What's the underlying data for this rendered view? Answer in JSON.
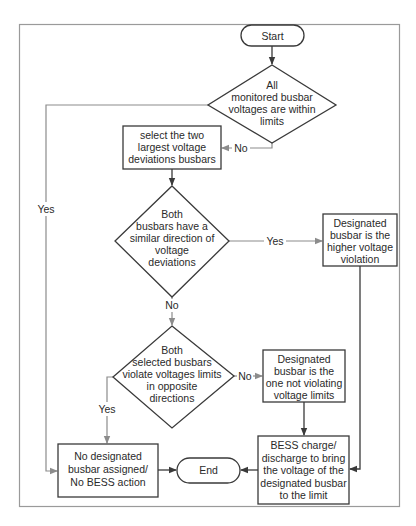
{
  "diagram": {
    "type": "flowchart",
    "nodes": {
      "start": {
        "kind": "terminal",
        "lines": [
          "Start"
        ]
      },
      "check_limits": {
        "kind": "decision",
        "lines": [
          "All",
          "monitored busbar",
          "voltages are within",
          "limits"
        ]
      },
      "select_two": {
        "kind": "process",
        "lines": [
          "select the two",
          "largest voltage",
          "deviations busbars"
        ]
      },
      "similar_direction": {
        "kind": "decision",
        "lines": [
          "Both",
          "busbars have a",
          "similar direction of",
          "voltage",
          "deviations"
        ]
      },
      "designated_higher": {
        "kind": "process",
        "lines": [
          "Designated",
          "busbar is  the",
          "higher voltage",
          "violation"
        ]
      },
      "opposite_directions": {
        "kind": "decision",
        "lines": [
          "Both",
          "selected busbars",
          "violate voltages limits",
          "in opposite",
          "directions"
        ]
      },
      "designated_not_violating": {
        "kind": "process",
        "lines": [
          "Designated",
          "busbar is the",
          "one not violating",
          "voltage limits"
        ]
      },
      "bess_action": {
        "kind": "process",
        "lines": [
          "BESS charge/",
          "discharge to bring",
          "the voltage of the",
          "designated busbar",
          "to the limit"
        ]
      },
      "no_action": {
        "kind": "process",
        "lines": [
          "No designated",
          "busbar assigned/",
          "No  BESS action"
        ]
      },
      "end": {
        "kind": "terminal",
        "lines": [
          "End"
        ]
      }
    },
    "edges": [
      {
        "from": "start",
        "to": "check_limits",
        "label": ""
      },
      {
        "from": "check_limits",
        "to": "select_two",
        "label": "No"
      },
      {
        "from": "check_limits",
        "to": "no_action",
        "label": "Yes"
      },
      {
        "from": "select_two",
        "to": "similar_direction",
        "label": ""
      },
      {
        "from": "similar_direction",
        "to": "designated_higher",
        "label": "Yes"
      },
      {
        "from": "similar_direction",
        "to": "opposite_directions",
        "label": "No"
      },
      {
        "from": "opposite_directions",
        "to": "designated_not_violating",
        "label": "No"
      },
      {
        "from": "opposite_directions",
        "to": "no_action",
        "label": "Yes"
      },
      {
        "from": "designated_not_violating",
        "to": "bess_action",
        "label": ""
      },
      {
        "from": "designated_higher",
        "to": "bess_action",
        "label": ""
      },
      {
        "from": "bess_action",
        "to": "end",
        "label": ""
      },
      {
        "from": "no_action",
        "to": "end",
        "label": ""
      }
    ],
    "labels": {
      "check_no": "No",
      "check_yes": "Yes",
      "similar_yes": "Yes",
      "similar_no": "No",
      "opposite_no": "No",
      "opposite_yes": "Yes"
    }
  }
}
